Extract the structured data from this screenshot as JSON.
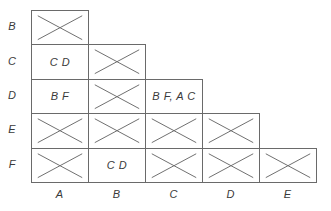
{
  "diagram": {
    "type": "implication-table",
    "row_labels": [
      "B",
      "C",
      "D",
      "E",
      "F"
    ],
    "col_labels": [
      "A",
      "B",
      "C",
      "D",
      "E"
    ],
    "cells": [
      {
        "row": "B",
        "col": "A",
        "crossed": true,
        "text": ""
      },
      {
        "row": "C",
        "col": "A",
        "crossed": false,
        "text": "C D"
      },
      {
        "row": "C",
        "col": "B",
        "crossed": true,
        "text": ""
      },
      {
        "row": "D",
        "col": "A",
        "crossed": false,
        "text": "B F"
      },
      {
        "row": "D",
        "col": "B",
        "crossed": true,
        "text": ""
      },
      {
        "row": "D",
        "col": "C",
        "crossed": false,
        "text": "B F, A C"
      },
      {
        "row": "E",
        "col": "A",
        "crossed": true,
        "text": ""
      },
      {
        "row": "E",
        "col": "B",
        "crossed": true,
        "text": ""
      },
      {
        "row": "E",
        "col": "C",
        "crossed": true,
        "text": ""
      },
      {
        "row": "E",
        "col": "D",
        "crossed": true,
        "text": ""
      },
      {
        "row": "F",
        "col": "A",
        "crossed": true,
        "text": ""
      },
      {
        "row": "F",
        "col": "B",
        "crossed": false,
        "text": "C D"
      },
      {
        "row": "F",
        "col": "C",
        "crossed": true,
        "text": ""
      },
      {
        "row": "F",
        "col": "D",
        "crossed": true,
        "text": ""
      },
      {
        "row": "F",
        "col": "E",
        "crossed": true,
        "text": ""
      }
    ]
  }
}
